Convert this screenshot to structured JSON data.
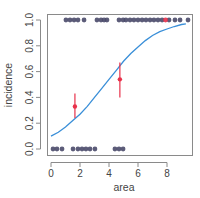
{
  "chart_data": {
    "type": "scatter",
    "title": "",
    "xlabel": "area",
    "ylabel": "incidence",
    "xlim": [
      -0.2,
      9.7
    ],
    "ylim": [
      -0.04,
      1.04
    ],
    "xticks": [
      0,
      2,
      4,
      6,
      8
    ],
    "xtick_labels": [
      "0",
      "2",
      "4",
      "6",
      "8"
    ],
    "yticks": [
      0.0,
      0.2,
      0.4,
      0.6,
      0.8,
      1.0
    ],
    "ytick_labels": [
      "0.0",
      "0.2",
      "0.4",
      "0.6",
      "0.8",
      "1.0"
    ],
    "grid": false,
    "legend": null,
    "series": [
      {
        "name": "observed incidence = 1",
        "kind": "points",
        "color": "#4a4a6a",
        "y": 1,
        "x": [
          1.03,
          1.31,
          1.59,
          1.86,
          2.28,
          3.17,
          3.45,
          3.66,
          3.86,
          4.69,
          4.97,
          5.17,
          5.45,
          5.72,
          6.0,
          6.28,
          6.55,
          6.83,
          7.1,
          7.38,
          7.66,
          8.14,
          8.55,
          8.9,
          9.45
        ]
      },
      {
        "name": "observed incidence = 0",
        "kind": "points",
        "color": "#4a4a6a",
        "y": 0,
        "x": [
          0.14,
          0.41,
          0.76,
          1.52,
          1.86,
          2.14,
          2.41,
          2.69,
          3.03,
          4.41,
          4.69,
          4.97
        ]
      },
      {
        "name": "highlighted point",
        "kind": "points",
        "color": "#e8314a",
        "y": 1,
        "x": [
          7.9
        ]
      },
      {
        "name": "logistic fit",
        "kind": "line",
        "color": "#3a8fd8",
        "x": [
          0,
          0.5,
          1,
          1.5,
          2,
          2.5,
          3,
          3.5,
          4,
          4.5,
          5,
          5.5,
          6,
          6.5,
          7,
          7.5,
          8,
          8.5,
          9,
          9.3
        ],
        "y": [
          0.1,
          0.13,
          0.17,
          0.22,
          0.27,
          0.33,
          0.4,
          0.47,
          0.54,
          0.61,
          0.68,
          0.74,
          0.79,
          0.84,
          0.88,
          0.91,
          0.93,
          0.95,
          0.965,
          0.97
        ]
      },
      {
        "name": "binned means with error bars",
        "kind": "errorbar",
        "color": "#e8314a",
        "x": [
          1.65,
          4.75
        ],
        "y": [
          0.33,
          0.54
        ],
        "ylow": [
          0.24,
          0.4
        ],
        "yhigh": [
          0.43,
          0.67
        ]
      }
    ]
  }
}
